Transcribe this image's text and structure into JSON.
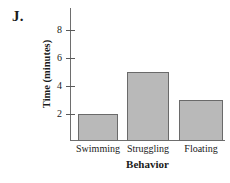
{
  "panel": {
    "letter": "J."
  },
  "chart_data": {
    "type": "bar",
    "title": "",
    "xlabel": "Behavior",
    "ylabel": "Time (minutes)",
    "categories": [
      "Swimming",
      "Struggling",
      "Floating"
    ],
    "values": [
      2,
      5,
      3
    ],
    "ylim": [
      0,
      9
    ],
    "yticks": [
      2,
      4,
      6,
      8
    ],
    "ytick_labels": [
      "2",
      "4",
      "6",
      "8"
    ],
    "grid": false,
    "legend": null,
    "series_name": "Time",
    "bar_fill_color": "#b9b9b9",
    "bar_edge_color": "#6a6a6a",
    "axis_color": "#6e6e6e",
    "background_color": "#ffffff"
  }
}
